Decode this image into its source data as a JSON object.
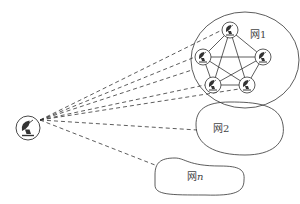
{
  "diagram": {
    "source_node": {
      "icon": "satellite-dish-icon"
    },
    "networks": [
      {
        "id": "net1",
        "label_prefix": "网",
        "label_suffix": "1",
        "suffix_italic": false,
        "node_count": 5,
        "fully_connected": true
      },
      {
        "id": "net2",
        "label_prefix": "网",
        "label_suffix": "2",
        "suffix_italic": false
      },
      {
        "id": "netn",
        "label_prefix": "网",
        "label_suffix": "n",
        "suffix_italic": true
      }
    ],
    "connections": {
      "style": "dashed",
      "to_net1_nodes": 5,
      "to_net1_boundary": 1,
      "to_net2": 1,
      "to_netn": 1
    },
    "colors": {
      "stroke": "#333333",
      "background": "#ffffff"
    }
  }
}
